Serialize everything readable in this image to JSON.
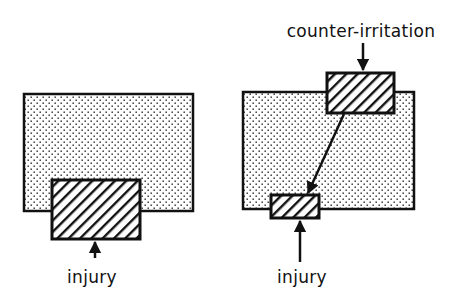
{
  "diagram": {
    "colors": {
      "ink": "#111111",
      "background": "#ffffff"
    },
    "left_panel": {
      "region": {
        "x": 24,
        "y": 94,
        "w": 169,
        "h": 117,
        "fill": "dotted"
      },
      "injury_box": {
        "x": 52,
        "y": 180,
        "w": 88,
        "h": 59,
        "fill": "hatched"
      },
      "injury_label": "injury"
    },
    "right_panel": {
      "region": {
        "x": 243,
        "y": 92,
        "w": 171,
        "h": 117,
        "fill": "dotted"
      },
      "counter_box": {
        "x": 327,
        "y": 73,
        "w": 67,
        "h": 40,
        "fill": "hatched"
      },
      "injury_box": {
        "x": 271,
        "y": 195,
        "w": 48,
        "h": 23,
        "fill": "hatched"
      },
      "counter_label": "counter-irritation",
      "injury_label": "injury"
    }
  }
}
